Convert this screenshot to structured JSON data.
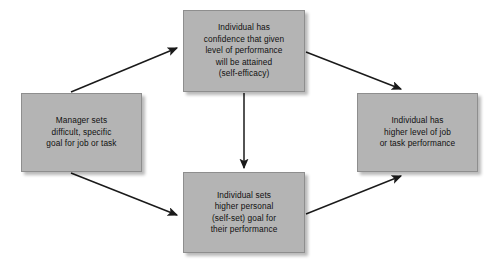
{
  "diagram": {
    "background_color": "#ffffff",
    "box_fill_color": "#b4b4b4",
    "box_border_color": "#8e8e8e",
    "text_color": "#101010",
    "arrow_color": "#1a1a1a",
    "nodes": [
      {
        "id": "manager-goal",
        "text": "Manager sets\ndifficult, specific\ngoal for job or task",
        "lines": [
          "Manager sets",
          "difficult, specific",
          "goal for job or task"
        ]
      },
      {
        "id": "self-efficacy",
        "text": "Individual has\nconfidence that given\nlevel of performance\nwill be attained\n(self-efficacy)",
        "lines": [
          "Individual has",
          "confidence that given",
          "level of performance",
          "will be attained",
          "(self-efficacy)"
        ]
      },
      {
        "id": "self-set-goal",
        "text": "Individual sets\nhigher personal\n(self-set) goal for\ntheir performance",
        "lines": [
          "Individual sets",
          "higher personal",
          "(self-set) goal for",
          "their performance"
        ]
      },
      {
        "id": "performance",
        "text": "Individual has\nhigher level of job\nor task performance",
        "lines": [
          "Individual has",
          "higher level of job",
          "or task performance"
        ]
      }
    ],
    "edges": [
      {
        "id": "manager-to-self-efficacy",
        "from": "manager-goal",
        "to": "self-efficacy",
        "label": ""
      },
      {
        "id": "manager-to-self-set-goal",
        "from": "manager-goal",
        "to": "self-set-goal",
        "label": ""
      },
      {
        "id": "self-efficacy-to-self-set-goal",
        "from": "self-efficacy",
        "to": "self-set-goal",
        "label": ""
      },
      {
        "id": "self-efficacy-to-performance",
        "from": "self-efficacy",
        "to": "performance",
        "label": ""
      },
      {
        "id": "self-set-goal-to-performance",
        "from": "self-set-goal",
        "to": "performance",
        "label": ""
      }
    ]
  }
}
